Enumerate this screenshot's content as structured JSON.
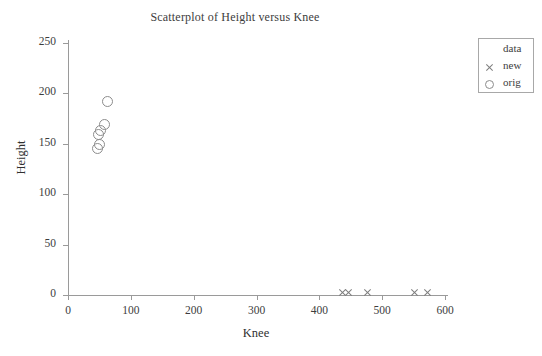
{
  "chart_data": {
    "type": "scatter",
    "title": "Scatterplot of Height versus Knee",
    "xlabel": "Knee",
    "ylabel": "Height",
    "xlim": [
      0,
      600
    ],
    "ylim": [
      0,
      250
    ],
    "xticks": [
      0,
      100,
      200,
      300,
      400,
      500,
      600
    ],
    "yticks": [
      0,
      50,
      100,
      150,
      200,
      250
    ],
    "grid": false,
    "legend": {
      "title": "data",
      "position": "upper right",
      "entries": [
        {
          "label": "new",
          "marker": "x"
        },
        {
          "label": "orig",
          "marker": "o"
        }
      ]
    },
    "series": [
      {
        "name": "orig",
        "marker": "o",
        "color": "#8c8c8c",
        "points": [
          {
            "x": 62,
            "y": 193
          },
          {
            "x": 57,
            "y": 170
          },
          {
            "x": 50,
            "y": 164
          },
          {
            "x": 47,
            "y": 160
          },
          {
            "x": 48,
            "y": 150
          },
          {
            "x": 45,
            "y": 146
          }
        ]
      },
      {
        "name": "new",
        "marker": "x",
        "color": "#7d7d7d",
        "points": [
          {
            "x": 437,
            "y": 2
          },
          {
            "x": 447,
            "y": 2
          },
          {
            "x": 477,
            "y": 2
          },
          {
            "x": 552,
            "y": 2
          },
          {
            "x": 572,
            "y": 2
          }
        ]
      }
    ]
  },
  "axis": {
    "x_tick_labels": [
      "0",
      "100",
      "200",
      "300",
      "400",
      "500",
      "600"
    ],
    "y_tick_labels": [
      "0",
      "50",
      "100",
      "150",
      "200",
      "250"
    ]
  }
}
